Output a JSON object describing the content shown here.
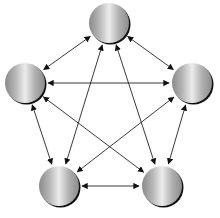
{
  "diagram": {
    "type": "complete-graph",
    "colors": {
      "background": "#ffffff",
      "edge": "#222222",
      "node_dark": "#8a8a8a",
      "node_light": "#e8e8e8",
      "node_shadow": "#111111"
    },
    "nodes": [
      {
        "id": "top",
        "cx": 109,
        "cy": 23,
        "r": 20
      },
      {
        "id": "left",
        "cx": 25,
        "cy": 83,
        "r": 20
      },
      {
        "id": "right",
        "cx": 192,
        "cy": 83,
        "r": 20
      },
      {
        "id": "bottom-left",
        "cx": 59,
        "cy": 186,
        "r": 20
      },
      {
        "id": "bottom-right",
        "cx": 162,
        "cy": 186,
        "r": 20
      }
    ],
    "edges": [
      {
        "from": "top",
        "to": "left",
        "bidirectional": true
      },
      {
        "from": "top",
        "to": "right",
        "bidirectional": true
      },
      {
        "from": "top",
        "to": "bottom-left",
        "bidirectional": true
      },
      {
        "from": "top",
        "to": "bottom-right",
        "bidirectional": true
      },
      {
        "from": "left",
        "to": "right",
        "bidirectional": true
      },
      {
        "from": "left",
        "to": "bottom-left",
        "bidirectional": true
      },
      {
        "from": "left",
        "to": "bottom-right",
        "bidirectional": true
      },
      {
        "from": "right",
        "to": "bottom-left",
        "bidirectional": true
      },
      {
        "from": "right",
        "to": "bottom-right",
        "bidirectional": true
      },
      {
        "from": "bottom-left",
        "to": "bottom-right",
        "bidirectional": true
      }
    ]
  }
}
